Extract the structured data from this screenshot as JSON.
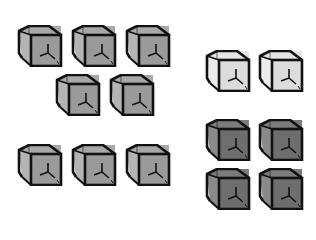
{
  "colors": {
    "medium": {
      "front": "#9a9a9a",
      "side": "#b4b4b4",
      "top": "#a8a8a8"
    },
    "light": {
      "front": "#dcdcdc",
      "side": "#ececec",
      "top": "#e4e4e4"
    },
    "dark": {
      "front": "#6e6e6e",
      "side": "#8a8a8a",
      "top": "#7c7c7c"
    },
    "stroke": "#111111"
  },
  "groups": [
    {
      "name": "left-group-top",
      "shade": "medium",
      "count": 5,
      "cubes": [
        [
          17,
          25
        ],
        [
          71,
          25
        ],
        [
          125,
          25
        ],
        [
          55,
          74
        ],
        [
          109,
          74
        ]
      ]
    },
    {
      "name": "left-group-bottom",
      "shade": "medium",
      "count": 3,
      "cubes": [
        [
          17,
          144
        ],
        [
          71,
          144
        ],
        [
          125,
          144
        ]
      ]
    },
    {
      "name": "right-group-light",
      "shade": "light",
      "count": 2,
      "cubes": [
        [
          205,
          50
        ],
        [
          258,
          50
        ]
      ]
    },
    {
      "name": "right-group-dark",
      "shade": "dark",
      "count": 4,
      "cubes": [
        [
          205,
          119
        ],
        [
          258,
          119
        ],
        [
          205,
          168
        ],
        [
          258,
          168
        ]
      ]
    }
  ]
}
